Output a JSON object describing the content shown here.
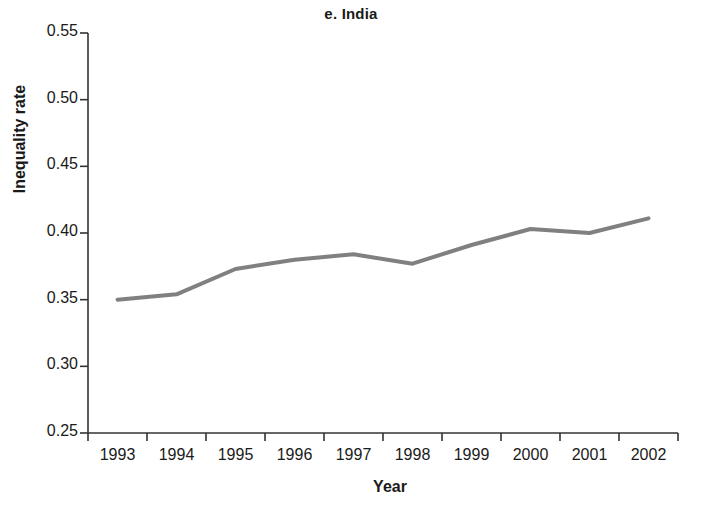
{
  "chart_data": {
    "type": "line",
    "title": "e. India",
    "xlabel": "Year",
    "ylabel": "Inequality rate",
    "xlim": [
      1992,
      2002
    ],
    "ylim": [
      0.25,
      0.55
    ],
    "grid": false,
    "legend": null,
    "line_color": "#808080",
    "axis_color": "#333333",
    "text_color": "#1a1a1a",
    "x": [
      1992.5,
      1993.5,
      1994.5,
      1995.5,
      1996.5,
      1997.5,
      1998.5,
      1999.5,
      2000.5,
      2001.5
    ],
    "values": [
      0.35,
      0.354,
      0.373,
      0.38,
      0.384,
      0.377,
      0.391,
      0.403,
      0.4,
      0.411
    ],
    "series": [
      {
        "name": "Inequality rate",
        "values": [
          0.35,
          0.354,
          0.373,
          0.38,
          0.384,
          0.377,
          0.391,
          0.403,
          0.4,
          0.411
        ]
      }
    ],
    "ytick_values": [
      0.55,
      0.5,
      0.45,
      0.4,
      0.35,
      0.3,
      0.25
    ],
    "ytick_labels": [
      "0.55",
      "0.50",
      "0.45",
      "0.40",
      "0.35",
      "0.30",
      "0.25"
    ],
    "xtick_values": [
      1992,
      1993,
      1994,
      1995,
      1996,
      1997,
      1998,
      1999,
      2000,
      2001,
      2002
    ],
    "xtick_labels": [
      "1993",
      "1994",
      "1995",
      "1996",
      "1997",
      "1998",
      "1999",
      "2000",
      "2001",
      "2002"
    ]
  }
}
